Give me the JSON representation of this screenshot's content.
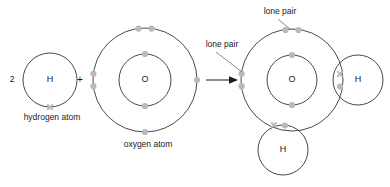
{
  "diagram": {
    "type": "dot-and-cross-diagram",
    "equation_coefficient": "2",
    "plus_sign": "+",
    "arrow": "→"
  },
  "reactants": {
    "hydrogen": {
      "symbol": "H",
      "caption": "hydrogen atom",
      "coefficient": "2",
      "shell_electrons": "1",
      "electron_mark": "cross"
    },
    "oxygen": {
      "symbol": "O",
      "caption": "oxygen atom",
      "inner_shell_electrons": "2",
      "outer_shell_electrons": "6",
      "electron_mark": "dot"
    }
  },
  "product": {
    "central_symbol": "O",
    "hydrogen_right_symbol": "H",
    "hydrogen_bottom_symbol": "H",
    "inner_shell_electrons": "2",
    "outer_shell_electrons": "8",
    "lone_pairs": "2",
    "bonding_pairs": "2"
  },
  "labels": {
    "lone_pair_top": "lone pair",
    "lone_pair_left": "lone pair"
  },
  "colors": {
    "shell_stroke": "#4a4a4a",
    "electron": "#b9b9b9",
    "text": "#1a1a1a",
    "leader": "#6b6b6b",
    "background": "#ffffff"
  }
}
